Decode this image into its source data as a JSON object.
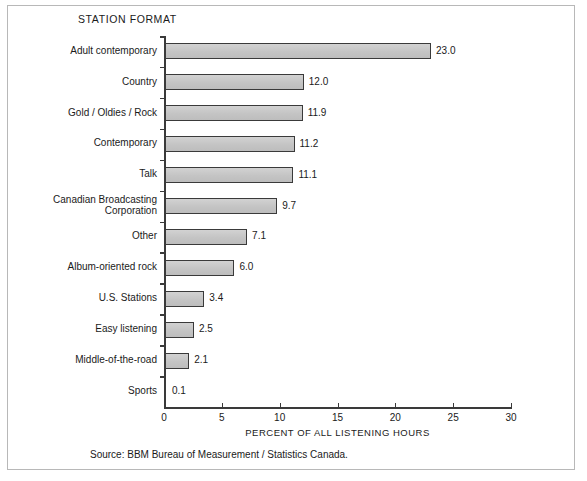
{
  "figure": {
    "title": "STATION FORMAT",
    "source_note": "Source: BBM Bureau of Measurement / Statistics Canada.",
    "border_color": "#b8b8b8",
    "background": "#ffffff"
  },
  "chart_data": {
    "type": "bar",
    "orientation": "horizontal",
    "title": "STATION FORMAT",
    "xlabel": "PERCENT OF ALL LISTENING HOURS",
    "ylabel": "",
    "xlim": [
      0,
      30
    ],
    "xticks": [
      0,
      5,
      10,
      15,
      20,
      25,
      30
    ],
    "xtick_labels": [
      "0",
      "5",
      "10",
      "15",
      "20",
      "25",
      "30"
    ],
    "grid": false,
    "legend": false,
    "bar_fill_color": "#c9c9c9",
    "bar_edge_color": "#3a3a3a",
    "categories": [
      "Adult contemporary",
      "Country",
      "Gold / Oldies / Rock",
      "Contemporary",
      "Talk",
      "Canadian Broadcasting\nCorporation",
      "Other",
      "Album-oriented rock",
      "U.S. Stations",
      "Easy listening",
      "Middle-of-the-road",
      "Sports"
    ],
    "values": [
      23.0,
      12.0,
      11.9,
      11.2,
      11.1,
      9.7,
      7.1,
      6.0,
      3.4,
      2.5,
      2.1,
      0.1
    ],
    "value_labels": [
      "23.0",
      "12.0",
      "11.9",
      "11.2",
      "11.1",
      "9.7",
      "7.1",
      "6.0",
      "3.4",
      "2.5",
      "2.1",
      "0.1"
    ]
  }
}
